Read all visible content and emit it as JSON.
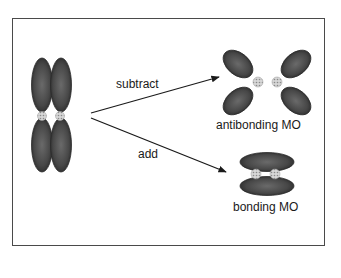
{
  "diagram": {
    "title": "",
    "source": {
      "name": "two parallel p orbitals",
      "orbitals": 2,
      "lobes_per_orbital": 2
    },
    "arrows": [
      {
        "label": "subtract",
        "from": "p-orbitals",
        "to": "antibonding MO"
      },
      {
        "label": "add",
        "from": "p-orbitals",
        "to": "bonding MO"
      }
    ],
    "results": [
      {
        "label": "antibonding MO",
        "shape": "four lobes tilted outward with node between nuclei"
      },
      {
        "label": "bonding MO",
        "shape": "two lobes above and below the internuclear axis"
      }
    ],
    "colors": {
      "lobe": "#3c3c3c",
      "lobe_highlight": "#6a6a6a",
      "nucleus": "#bdbdbd",
      "frame": "#4a4a4a",
      "arrow": "#1a1a1a"
    }
  }
}
